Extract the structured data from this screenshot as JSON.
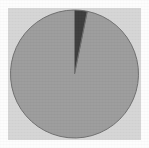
{
  "chart_data": {
    "type": "pie",
    "title": "",
    "subtitle": "",
    "xlabel": "",
    "ylabel": "",
    "legend_position": "none",
    "grid": false,
    "labels": [
      "Slice 1",
      "Slice 2"
    ],
    "values": [
      96.8,
      3.2
    ],
    "units": "percent",
    "start_angle_deg": 90,
    "direction": "counterclockwise",
    "colors": [
      "#9c9c9c",
      "#3d3d3d"
    ],
    "slices": [
      {
        "label": "Slice 1",
        "value": 96.8,
        "color": "#9c9c9c",
        "start_deg": 90,
        "sweep_deg": 348.5
      },
      {
        "label": "Slice 2",
        "value": 3.2,
        "color": "#3d3d3d",
        "start_deg": 78.5,
        "sweep_deg": 11.5
      }
    ],
    "annotations": [],
    "tick_labels": []
  },
  "figure": {
    "background_color": "#fdfdfd",
    "plot_background_color": "#d6d6d6",
    "edge_color": "#6f6f6f",
    "center_x": 74.5,
    "center_y": 74,
    "radius": 64
  }
}
